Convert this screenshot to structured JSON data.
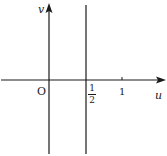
{
  "diagram": {
    "type": "coordinate-plane",
    "axes": {
      "horizontal": {
        "label": "u"
      },
      "vertical": {
        "label": "v"
      },
      "origin_label": "O"
    },
    "tick_labels": {
      "half": {
        "numerator": "1",
        "denominator": "2"
      },
      "one": "1"
    },
    "lines": [
      {
        "equation": "u = 1/2",
        "orientation": "vertical"
      }
    ],
    "colors": {
      "ink": "#1a1a1a",
      "background": "#ffffff"
    }
  }
}
